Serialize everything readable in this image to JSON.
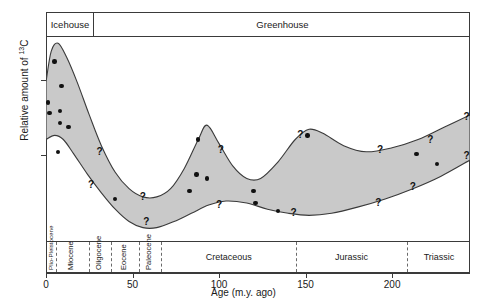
{
  "figure": {
    "ylabel_pre": "Relative amount of ",
    "ylabel_sup": "13",
    "ylabel_post": "C",
    "xlabel": "Age (m.y. ago)"
  },
  "climate_modes": [
    {
      "label": "Icehouse"
    },
    {
      "label": "Greenhouse"
    }
  ],
  "chart_data": {
    "type": "area",
    "xlabel": "Age (m.y. ago)",
    "ylabel": "Relative amount of 13C",
    "xlim": [
      0,
      245
    ],
    "ylim": [
      0,
      1
    ],
    "x_reversed": false,
    "grid": false,
    "legend": "none",
    "axis_note": "y-axis is unitless relative scale with two unlabeled tick marks",
    "x_ticks": [
      0,
      50,
      100,
      150,
      200
    ],
    "y_ticks_unlabeled": 2,
    "band_description": "Shaded gray envelope spanning an upper and a lower bound curve, representing the uncertainty range of relative 13C; high at 0-10 m.y. (Plio-Pleistocene/Miocene), dropping to a minimum near 60-70 m.y., a secondary peak near 90 m.y. (mid Cretaceous), a trough near 120 m.y., a broad peak near 150 m.y. (Jurassic), then rising again toward 245 m.y. (Triassic).",
    "band_upper": [
      {
        "x": 0,
        "y": 0.78
      },
      {
        "x": 3,
        "y": 0.93
      },
      {
        "x": 7,
        "y": 0.97
      },
      {
        "x": 12,
        "y": 0.9
      },
      {
        "x": 18,
        "y": 0.78
      },
      {
        "x": 25,
        "y": 0.62
      },
      {
        "x": 32,
        "y": 0.47
      },
      {
        "x": 40,
        "y": 0.34
      },
      {
        "x": 48,
        "y": 0.26
      },
      {
        "x": 56,
        "y": 0.22
      },
      {
        "x": 64,
        "y": 0.22
      },
      {
        "x": 72,
        "y": 0.26
      },
      {
        "x": 80,
        "y": 0.36
      },
      {
        "x": 88,
        "y": 0.5
      },
      {
        "x": 93,
        "y": 0.57
      },
      {
        "x": 100,
        "y": 0.48
      },
      {
        "x": 108,
        "y": 0.37
      },
      {
        "x": 116,
        "y": 0.31
      },
      {
        "x": 124,
        "y": 0.31
      },
      {
        "x": 134,
        "y": 0.39
      },
      {
        "x": 144,
        "y": 0.5
      },
      {
        "x": 152,
        "y": 0.55
      },
      {
        "x": 160,
        "y": 0.53
      },
      {
        "x": 172,
        "y": 0.47
      },
      {
        "x": 185,
        "y": 0.44
      },
      {
        "x": 200,
        "y": 0.46
      },
      {
        "x": 215,
        "y": 0.5
      },
      {
        "x": 230,
        "y": 0.56
      },
      {
        "x": 245,
        "y": 0.62
      }
    ],
    "band_lower": [
      {
        "x": 0,
        "y": 0.5
      },
      {
        "x": 5,
        "y": 0.52
      },
      {
        "x": 10,
        "y": 0.5
      },
      {
        "x": 16,
        "y": 0.43
      },
      {
        "x": 24,
        "y": 0.33
      },
      {
        "x": 32,
        "y": 0.24
      },
      {
        "x": 40,
        "y": 0.16
      },
      {
        "x": 48,
        "y": 0.1
      },
      {
        "x": 56,
        "y": 0.07
      },
      {
        "x": 64,
        "y": 0.07
      },
      {
        "x": 74,
        "y": 0.1
      },
      {
        "x": 84,
        "y": 0.14
      },
      {
        "x": 94,
        "y": 0.18
      },
      {
        "x": 104,
        "y": 0.2
      },
      {
        "x": 116,
        "y": 0.19
      },
      {
        "x": 128,
        "y": 0.16
      },
      {
        "x": 140,
        "y": 0.14
      },
      {
        "x": 152,
        "y": 0.13
      },
      {
        "x": 165,
        "y": 0.14
      },
      {
        "x": 180,
        "y": 0.17
      },
      {
        "x": 196,
        "y": 0.21
      },
      {
        "x": 212,
        "y": 0.26
      },
      {
        "x": 228,
        "y": 0.32
      },
      {
        "x": 245,
        "y": 0.4
      }
    ],
    "data_points": [
      {
        "x": 5,
        "y": 0.88
      },
      {
        "x": 9,
        "y": 0.76
      },
      {
        "x": 1,
        "y": 0.68
      },
      {
        "x": 2,
        "y": 0.63
      },
      {
        "x": 8,
        "y": 0.64
      },
      {
        "x": 8,
        "y": 0.58
      },
      {
        "x": 13,
        "y": 0.56
      },
      {
        "x": 7,
        "y": 0.44
      },
      {
        "x": 40,
        "y": 0.21
      },
      {
        "x": 88,
        "y": 0.5
      },
      {
        "x": 87,
        "y": 0.33
      },
      {
        "x": 93,
        "y": 0.31
      },
      {
        "x": 83,
        "y": 0.25
      },
      {
        "x": 120,
        "y": 0.25
      },
      {
        "x": 121,
        "y": 0.19
      },
      {
        "x": 151,
        "y": 0.52
      },
      {
        "x": 134,
        "y": 0.15
      },
      {
        "x": 214,
        "y": 0.43
      },
      {
        "x": 226,
        "y": 0.38
      }
    ],
    "uncertainty_marks": [
      {
        "x": 31,
        "y": 0.44,
        "symbol": "?"
      },
      {
        "x": 26,
        "y": 0.28,
        "symbol": "?"
      },
      {
        "x": 56,
        "y": 0.22,
        "symbol": "?"
      },
      {
        "x": 58,
        "y": 0.1,
        "symbol": "?"
      },
      {
        "x": 101,
        "y": 0.45,
        "symbol": "?"
      },
      {
        "x": 100,
        "y": 0.18,
        "symbol": "?"
      },
      {
        "x": 147,
        "y": 0.52,
        "symbol": "?"
      },
      {
        "x": 143,
        "y": 0.14,
        "symbol": "?"
      },
      {
        "x": 193,
        "y": 0.45,
        "symbol": "?"
      },
      {
        "x": 192,
        "y": 0.19,
        "symbol": "?"
      },
      {
        "x": 222,
        "y": 0.5,
        "symbol": "?"
      },
      {
        "x": 212,
        "y": 0.27,
        "symbol": "?"
      },
      {
        "x": 243,
        "y": 0.61,
        "symbol": "?"
      },
      {
        "x": 243,
        "y": 0.42,
        "symbol": "?"
      }
    ]
  },
  "timescale": {
    "units": [
      {
        "label": "Plio-Pleistocene",
        "start": 0,
        "end": 5,
        "orientation": "vertical",
        "size": "tiny"
      },
      {
        "label": "Miocene",
        "start": 5,
        "end": 24,
        "orientation": "vertical",
        "size": "normal"
      },
      {
        "label": "Oligocene",
        "start": 24,
        "end": 37,
        "orientation": "vertical",
        "size": "normal"
      },
      {
        "label": "Eocene",
        "start": 37,
        "end": 53,
        "orientation": "vertical",
        "size": "normal"
      },
      {
        "label": "Paleocene",
        "start": 53,
        "end": 66,
        "orientation": "vertical",
        "size": "normal"
      },
      {
        "label": "Cretaceous",
        "start": 66,
        "end": 144,
        "orientation": "horizontal",
        "size": "normal"
      },
      {
        "label": "Jurassic",
        "start": 144,
        "end": 208,
        "orientation": "horizontal",
        "size": "normal"
      },
      {
        "label": "Triassic",
        "start": 208,
        "end": 245,
        "orientation": "horizontal",
        "size": "normal"
      }
    ]
  },
  "colors": {
    "band_fill": "#c9c9c9",
    "band_stroke": "#3a3a3a",
    "point": "#111111",
    "axis": "#3a3a3a",
    "divider": "#6a6a6a"
  }
}
